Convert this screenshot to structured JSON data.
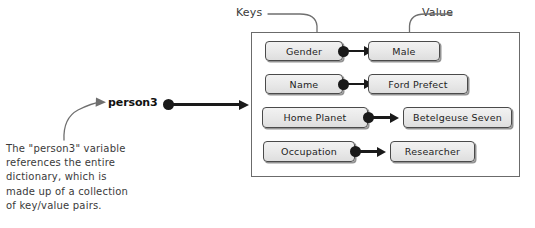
{
  "diagram": {
    "title_pointer": {
      "variable_label": "person3",
      "dot_icon": "filled-circle-reference-dot",
      "arrow_icon": "right-arrow"
    },
    "annotations": {
      "keys_label": "Keys",
      "value_label": "Value"
    },
    "container": {
      "name": "dictionary-container"
    },
    "pairs": [
      {
        "key": "Gender",
        "value": "Male"
      },
      {
        "key": "Name",
        "value": "Ford Prefect"
      },
      {
        "key": "Home Planet",
        "value": "Betelgeuse Seven"
      },
      {
        "key": "Occupation",
        "value": "Researcher"
      }
    ],
    "caption": {
      "line1": "The \"person3\" variable",
      "line2": "references the entire",
      "line3": "dictionary, which is",
      "line4": "made up of a collection",
      "line5": "of key/value pairs."
    },
    "colors": {
      "ink": "#2b2b2b",
      "connector": "#1a1a1a",
      "chip_border": "#4a4a4a",
      "chip_fill": "#e8e8e8",
      "container_border": "#6b6b6b",
      "background": "#ffffff"
    }
  }
}
